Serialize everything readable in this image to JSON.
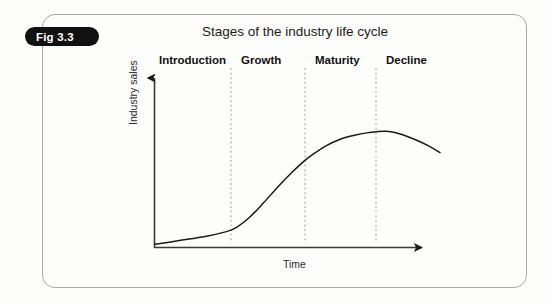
{
  "figure": {
    "tag_label": "Fig 3.3",
    "title": "Stages of the industry life cycle",
    "frame_color": "#a9a9a9",
    "tag_bg_color": "#111111",
    "tag_text_color": "#ffffff"
  },
  "chart_data": {
    "type": "line",
    "title": "Stages of the industry life cycle",
    "xlabel": "Time",
    "ylabel": "Industry sales",
    "grid": false,
    "legend": null,
    "xlim": [
      0,
      100
    ],
    "ylim": [
      0,
      100
    ],
    "axis_style": "arrow-axes-no-ticks",
    "stages": [
      {
        "name": "Introduction",
        "x_start": 0,
        "x_end": 28
      },
      {
        "name": "Growth",
        "x_start": 28,
        "x_end": 55
      },
      {
        "name": "Maturity",
        "x_start": 55,
        "x_end": 81
      },
      {
        "name": "Decline",
        "x_start": 81,
        "x_end": 100
      }
    ],
    "stage_dividers_x": [
      28,
      55,
      81
    ],
    "divider_style": "dashed",
    "series": [
      {
        "name": "Industry sales",
        "color": "#1a1a1a",
        "x": [
          0,
          6,
          12,
          18,
          24,
          28,
          33,
          38,
          43,
          48,
          52,
          55,
          60,
          65,
          70,
          75,
          81,
          86,
          91,
          96,
          100
        ],
        "y": [
          2,
          4,
          6,
          8,
          11,
          14,
          22,
          33,
          45,
          56,
          64,
          69,
          76,
          81,
          84,
          86,
          87,
          85,
          81,
          76,
          71
        ]
      }
    ]
  },
  "labels": {
    "stage_1": "Introduction",
    "stage_2": "Growth",
    "stage_3": "Maturity",
    "stage_4": "Decline",
    "y_axis": "Industry sales",
    "x_axis": "Time"
  }
}
